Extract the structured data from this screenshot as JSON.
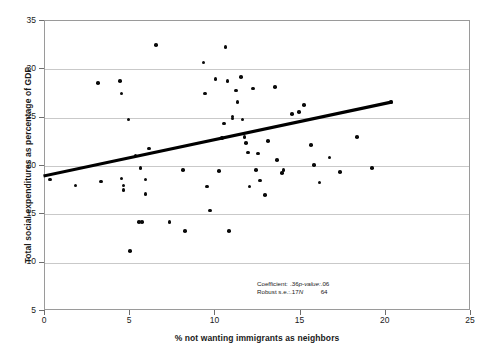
{
  "chart_data": {
    "type": "scatter",
    "title": "",
    "xlabel": "% not wanting immigrants as neighbors",
    "ylabel": "Total social expenditures as percentage of GDP",
    "xlim": [
      0,
      25
    ],
    "ylim": [
      5,
      35
    ],
    "xticks": [
      0,
      5,
      10,
      15,
      20,
      25
    ],
    "yticks": [
      5,
      10,
      15,
      20,
      25,
      30,
      35
    ],
    "grid": "horizontal",
    "legend": "none",
    "series": [
      {
        "name": "countries",
        "points": [
          [
            0.3,
            18.6
          ],
          [
            1.8,
            18.0
          ],
          [
            3.1,
            28.6
          ],
          [
            3.3,
            18.4
          ],
          [
            4.4,
            28.8
          ],
          [
            4.5,
            27.5
          ],
          [
            4.5,
            18.7
          ],
          [
            4.6,
            18.0
          ],
          [
            4.6,
            17.5
          ],
          [
            4.9,
            24.8
          ],
          [
            5.0,
            11.2
          ],
          [
            5.3,
            21.1
          ],
          [
            5.5,
            14.2
          ],
          [
            5.7,
            14.2
          ],
          [
            5.6,
            19.8
          ],
          [
            5.9,
            18.6
          ],
          [
            5.9,
            17.1
          ],
          [
            6.1,
            21.8
          ],
          [
            6.5,
            32.5
          ],
          [
            7.3,
            14.2
          ],
          [
            8.1,
            19.6
          ],
          [
            8.2,
            13.3
          ],
          [
            9.3,
            30.7
          ],
          [
            9.4,
            27.5
          ],
          [
            9.5,
            17.9
          ],
          [
            9.7,
            15.4
          ],
          [
            10.0,
            29.0
          ],
          [
            10.2,
            19.5
          ],
          [
            10.4,
            22.9
          ],
          [
            10.5,
            24.4
          ],
          [
            10.6,
            32.3
          ],
          [
            10.7,
            28.8
          ],
          [
            10.8,
            13.3
          ],
          [
            11.0,
            25.1
          ],
          [
            11.0,
            24.9
          ],
          [
            11.2,
            27.8
          ],
          [
            11.3,
            26.6
          ],
          [
            11.5,
            29.2
          ],
          [
            11.6,
            24.8
          ],
          [
            11.7,
            23.0
          ],
          [
            11.8,
            22.4
          ],
          [
            11.9,
            21.4
          ],
          [
            12.0,
            17.9
          ],
          [
            12.2,
            28.0
          ],
          [
            12.4,
            19.6
          ],
          [
            12.5,
            21.3
          ],
          [
            12.6,
            18.5
          ],
          [
            12.9,
            17.0
          ],
          [
            13.1,
            22.6
          ],
          [
            13.5,
            28.2
          ],
          [
            13.6,
            20.6
          ],
          [
            13.9,
            19.3
          ],
          [
            14.0,
            19.6
          ],
          [
            14.5,
            25.4
          ],
          [
            14.9,
            25.6
          ],
          [
            15.2,
            26.3
          ],
          [
            15.6,
            22.2
          ],
          [
            15.8,
            20.1
          ],
          [
            16.1,
            18.3
          ],
          [
            16.7,
            20.9
          ],
          [
            17.3,
            19.4
          ],
          [
            18.3,
            23.0
          ],
          [
            19.2,
            19.8
          ],
          [
            20.3,
            26.6
          ]
        ]
      }
    ],
    "trendline": {
      "x0": 0.0,
      "y0": 19.0,
      "x1": 20.3,
      "y1": 26.6
    }
  },
  "annotation": {
    "coefficient_key": "Coefficient:",
    "coefficient_value": ".36",
    "pvalue_key": "p-value:",
    "pvalue_value": ".06",
    "se_key": "Robust s.e.:",
    "se_value": ".17",
    "n_key": "N",
    "n_value": "64"
  }
}
